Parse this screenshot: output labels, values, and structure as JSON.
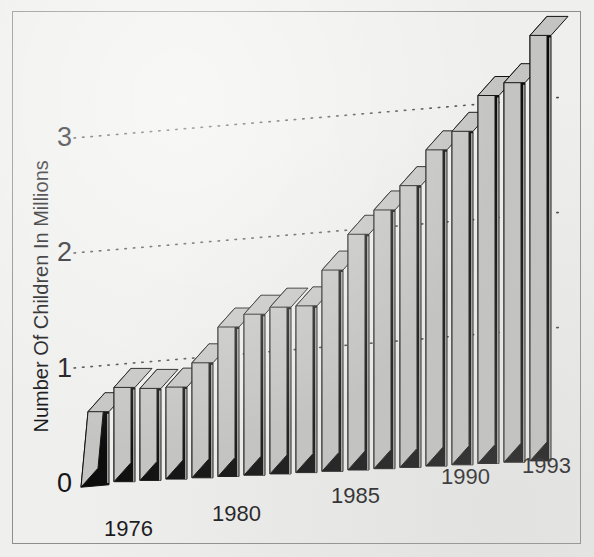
{
  "chart_data": {
    "type": "bar",
    "title": "",
    "subtitle": "",
    "xlabel": "",
    "ylabel": "Number Of Children In Millions",
    "categories": [
      "1976",
      "1977",
      "1978",
      "1979",
      "1980",
      "1981",
      "1982",
      "1983",
      "1984",
      "1985",
      "1986",
      "1987",
      "1988",
      "1989",
      "1990",
      "1991",
      "1992",
      "1993"
    ],
    "values": [
      0.62,
      0.82,
      0.8,
      0.8,
      1.0,
      1.3,
      1.4,
      1.45,
      1.45,
      1.75,
      2.05,
      2.25,
      2.45,
      2.75,
      2.9,
      3.2,
      3.3,
      3.7
    ],
    "ylim": [
      0,
      4
    ],
    "yticks": [
      0,
      1,
      2,
      3
    ],
    "ytick_labels": [
      "0",
      "1",
      "2",
      "3"
    ],
    "xtick_labels": [
      "1976",
      "1980",
      "1985",
      "1990",
      "1993"
    ],
    "xtick_indices": [
      0,
      4,
      9,
      14,
      17
    ],
    "grid": true,
    "grid_style": "dotted",
    "legend": "none",
    "style_3d": true,
    "annotations": []
  },
  "colors": {
    "background": "#efefed",
    "border": "#8e8e8c",
    "bar_front": "#0b0b0b",
    "bar_top": "#c4c4c2",
    "bar_side": "#c4c4c2",
    "bar_outline": "#111111",
    "grid_dot": "#4a4a4a",
    "text": "#17171a"
  },
  "axis": {
    "y_label_text": "Number Of Children In Millions",
    "tick_0": "0",
    "tick_1": "1",
    "tick_2": "2",
    "tick_3": "3",
    "x_1976": "1976",
    "x_1980": "1980",
    "x_1985": "1985",
    "x_1990": "1990",
    "x_1993": "1993"
  }
}
